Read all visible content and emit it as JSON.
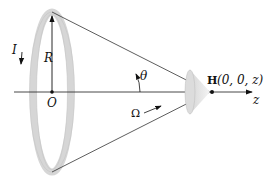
{
  "diagram": {
    "labels": {
      "current": "I",
      "radius": "R",
      "origin": "O",
      "angle": "θ",
      "solid_angle": "Ω",
      "point_bold": "H",
      "point_coords": "(0, 0, z)",
      "axis": "z"
    },
    "colors": {
      "ring": "#d9d9d9",
      "ring_edge": "#bdbdbd",
      "lines": "#333333",
      "cone_fill": "#e6e6e6"
    }
  }
}
